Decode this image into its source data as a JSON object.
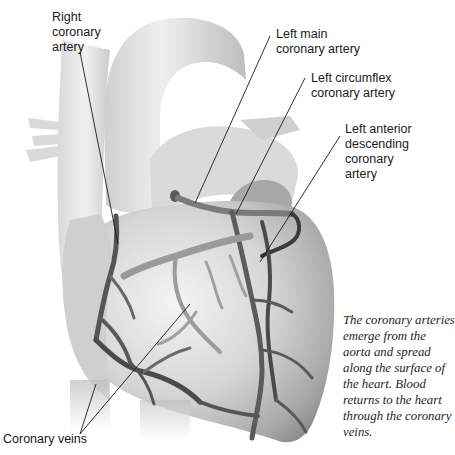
{
  "diagram": {
    "labels": [
      {
        "id": "right-coronary-artery",
        "text": "Right\ncoronary\nartery"
      },
      {
        "id": "left-main-coronary-artery",
        "text": "Left main\ncoronary artery"
      },
      {
        "id": "left-circumflex-coronary-artery",
        "text": "Left circumflex\ncoronary artery"
      },
      {
        "id": "left-anterior-descending-coronary-artery",
        "text": "Left anterior\ndescending\ncoronary\nartery"
      },
      {
        "id": "coronary-veins",
        "text": "Coronary veins"
      }
    ],
    "caption": "The coronary arteries emerge from the aorta and spread along the surface of the heart. Blood returns to the heart through the coronary veins.",
    "colors": {
      "background": "#ffffff",
      "heart_light": "#e6e6e6",
      "heart_mid": "#bdbdbd",
      "heart_dark": "#8a8a8a",
      "vessel": "#6e6e6e",
      "vessel_dark": "#3a3a3a",
      "leader_line": "#1a1a1a",
      "text": "#1a1a1a"
    }
  }
}
